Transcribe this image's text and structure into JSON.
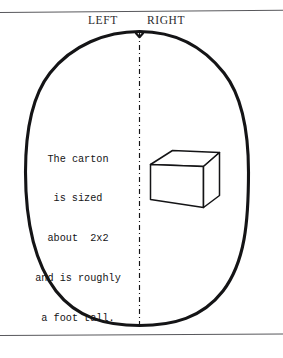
{
  "figure": {
    "orientation_labels": {
      "left": "LEFT",
      "right": "RIGHT"
    },
    "caption_lines": [
      "The carton",
      "is sized",
      "about  2x2",
      "and is roughly",
      "a foot tall."
    ],
    "shapes": {
      "outline_name": "oval-body-outline",
      "centerline_name": "vertical-centerline",
      "box_name": "carton-box"
    },
    "colors": {
      "ink": "#141416",
      "rule": "#58585c",
      "paper": "#ffffff"
    }
  }
}
